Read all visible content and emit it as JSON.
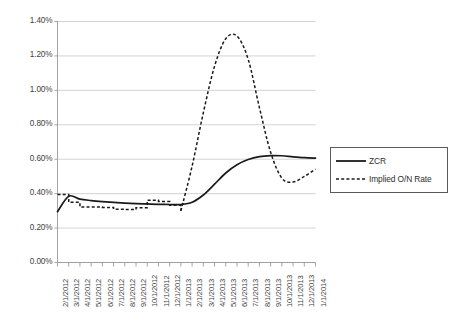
{
  "chart_data": {
    "type": "line",
    "title": "",
    "subtitle": "",
    "xlabel": "",
    "ylabel": "",
    "grid": true,
    "legend_position": "right",
    "ylim": [
      0.0,
      1.4
    ],
    "y_tick_labels": [
      "0.00%",
      "0.20%",
      "0.40%",
      "0.60%",
      "0.80%",
      "1.00%",
      "1.20%",
      "1.40%"
    ],
    "y_ticks": [
      0.0,
      0.2,
      0.4,
      0.6,
      0.8,
      1.0,
      1.2,
      1.4
    ],
    "categories": [
      "2/1/2012",
      "3/1/2012",
      "4/1/2012",
      "5/1/2012",
      "6/1/2012",
      "7/1/2012",
      "8/1/2012",
      "9/1/2012",
      "10/1/2012",
      "11/1/2012",
      "12/1/2012",
      "1/1/2013",
      "2/1/2013",
      "3/1/2013",
      "4/1/2013",
      "5/1/2013",
      "6/1/2013",
      "7/1/2013",
      "8/1/2013",
      "9/1/2013",
      "10/1/2013",
      "11/1/2013",
      "12/1/2013",
      "1/1/2014"
    ],
    "series": [
      {
        "name": "ZCR",
        "style": "solid",
        "color": "#1a1a1a",
        "values": [
          0.295,
          0.385,
          0.368,
          0.36,
          0.354,
          0.349,
          0.345,
          0.342,
          0.34,
          0.338,
          0.337,
          0.337,
          0.35,
          0.392,
          0.455,
          0.52,
          0.568,
          0.598,
          0.615,
          0.621,
          0.62,
          0.614,
          0.609,
          0.606
        ]
      },
      {
        "name": "Implied O/N Rate",
        "style": "dashed",
        "color": "#1a1a1a",
        "values": [
          0.395,
          0.35,
          0.322,
          0.322,
          0.32,
          0.31,
          0.308,
          0.318,
          0.362,
          0.355,
          0.332,
          0.3,
          0.56,
          0.87,
          1.14,
          1.3,
          1.315,
          1.18,
          0.9,
          0.64,
          0.49,
          0.468,
          0.5,
          0.543
        ]
      }
    ],
    "annotations": {
      "peak_value": "1.32%",
      "peak_category": "6/1/2013",
      "trough_value": "0.47%",
      "trough_category": "11/1/2013"
    }
  },
  "legend": {
    "items": [
      {
        "label": "ZCR",
        "style": "solid"
      },
      {
        "label": "Implied O/N Rate",
        "style": "dashed"
      }
    ]
  }
}
